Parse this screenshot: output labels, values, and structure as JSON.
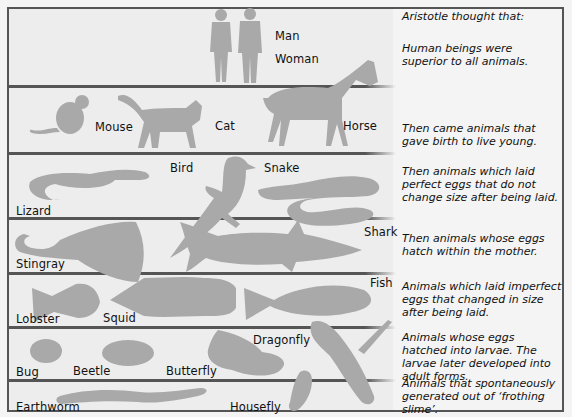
{
  "colors": {
    "background": "#ededed",
    "silhouette": "#a9a9a9",
    "rule": "#555555",
    "text": "#111111"
  },
  "levels": [
    {
      "animals": [
        "Man",
        "Woman"
      ],
      "description": "Human beings were superior to all animals."
    },
    {
      "animals": [
        "Mouse",
        "Cat",
        "Horse"
      ],
      "description": "Then came animals that gave birth to live young."
    },
    {
      "animals": [
        "Lizard",
        "Bird",
        "Snake"
      ],
      "description": "Then animals which laid perfect eggs that do not change size after being laid."
    },
    {
      "animals": [
        "Stingray",
        "Shark"
      ],
      "description": "Then animals whose eggs hatch within the mother."
    },
    {
      "animals": [
        "Lobster",
        "Squid",
        "Fish"
      ],
      "description": "Animals which laid imperfect eggs that changed in size after being laid."
    },
    {
      "animals": [
        "Bug",
        "Beetle",
        "Butterfly",
        "Dragonfly"
      ],
      "description": "Animals whose eggs hatched into larvae. The larvae later developed into adult forms."
    },
    {
      "animals": [
        "Earthworm",
        "Housefly"
      ],
      "description": "Animals that spontaneously generated out of 'frothing slime'."
    }
  ],
  "heading": "Aristotle thought that:",
  "labels": {
    "man": "Man",
    "woman": "Woman",
    "mouse": "Mouse",
    "cat": "Cat",
    "horse": "Horse",
    "lizard": "Lizard",
    "bird": "Bird",
    "snake": "Snake",
    "stingray": "Stingray",
    "shark": "Shark",
    "lobster": "Lobster",
    "squid": "Squid",
    "fish": "Fish",
    "bug": "Bug",
    "beetle": "Beetle",
    "butterfly": "Butterfly",
    "dragonfly": "Dragonfly",
    "earthworm": "Earthworm",
    "housefly": "Housefly"
  },
  "descriptions": {
    "d0": "Human beings were superior to all animals.",
    "d1": "Then came animals that gave birth to live young.",
    "d2": "Then animals which laid perfect eggs that do not change size after being laid.",
    "d3": "Then animals whose eggs hatch within the mother.",
    "d4": "Animals which laid imperfect eggs that changed in size after being laid.",
    "d5": "Animals whose eggs hatched into larvae. The larvae later developed into adult forms.",
    "d6": "Animals that spontaneously generated out of ‘frothing slime’."
  }
}
